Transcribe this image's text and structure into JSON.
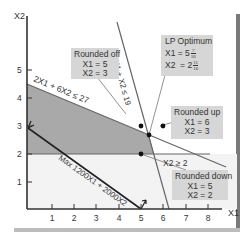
{
  "figure": {
    "axes": {
      "x_label": "X1",
      "y_label": "X2",
      "x_ticks": [
        "1",
        "2",
        "3",
        "4",
        "5",
        "6",
        "7",
        "8"
      ],
      "y_ticks": [
        "1",
        "2",
        "3",
        "4",
        "5"
      ]
    },
    "constraints": {
      "c1": "2X1 + 6X2 ≤ 27",
      "c2": "3X1 + X2 ≤ 19",
      "c3": "X2 ≥ 2"
    },
    "objective": "Max 1200X1 + 2000X2",
    "callouts": {
      "rounded_off": {
        "title": "Rounded off",
        "x1": "X1 = 5",
        "x2": "X2 = 3"
      },
      "lp_optimum": {
        "title": "LP Optimum",
        "x1_prefix": "X1 = 5",
        "x1_num": "7",
        "x1_den": "16",
        "x2_prefix": "X2  = 2",
        "x2_num": "11",
        "x2_den": "16"
      },
      "rounded_up": {
        "title": "Rounded up",
        "x1": "X1 = 6",
        "x2": "X2 = 3"
      },
      "rounded_down": {
        "title": "Rounded down",
        "x1": "X1 = 5",
        "x2": "X2 = 2"
      }
    },
    "colors": {
      "feasible_dark": "#a9a9a9",
      "feasible_light": "#ececec",
      "callout_bg": "#d6d6d6",
      "frame": "#7a7a7a",
      "line": "#555555"
    }
  }
}
